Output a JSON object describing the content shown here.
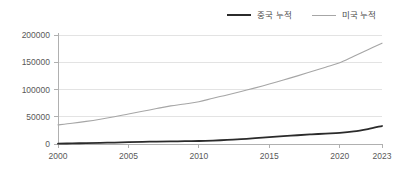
{
  "chart_data": {
    "type": "line",
    "title": "",
    "subtitle": "",
    "xlabel": "",
    "ylabel": "",
    "xlim": [
      2000,
      2023
    ],
    "ylim": [
      0,
      200000
    ],
    "grid": "horizontal",
    "legend_position": "top-right",
    "background_color": "#ffffff",
    "grid_color": "#e3e3e3",
    "axis_color": "#b0b0b0",
    "x": [
      2000,
      2001,
      2002,
      2003,
      2004,
      2005,
      2006,
      2007,
      2008,
      2009,
      2010,
      2011,
      2012,
      2013,
      2014,
      2015,
      2016,
      2017,
      2018,
      2019,
      2020,
      2021,
      2022,
      2023
    ],
    "xticks": [
      2000,
      2005,
      2010,
      2015,
      2020,
      2023
    ],
    "xtick_labels": [
      "2000",
      "2005",
      "2010",
      "2015",
      "2020",
      "2023"
    ],
    "yticks": [
      0,
      50000,
      100000,
      150000,
      200000
    ],
    "ytick_labels": [
      "0",
      "50000",
      "100000",
      "150000",
      "200000"
    ],
    "series": [
      {
        "name": "중국 누적",
        "color": "#2b2b2b",
        "line_width": 1.8,
        "values": [
          700,
          1100,
          1600,
          2100,
          2700,
          3300,
          3900,
          4400,
          4800,
          5100,
          5500,
          6300,
          7400,
          8800,
          10600,
          12600,
          14400,
          16100,
          17700,
          19100,
          20400,
          23000,
          27500,
          33000
        ]
      },
      {
        "name": "미국 누적",
        "color": "#a6a6a6",
        "line_width": 1.1,
        "values": [
          35000,
          38000,
          41500,
          45500,
          50000,
          55000,
          60000,
          65000,
          70000,
          73500,
          77500,
          84000,
          90000,
          96500,
          103000,
          110000,
          117500,
          125000,
          133000,
          141000,
          149000,
          161000,
          173000,
          185000
        ]
      }
    ]
  },
  "legend": {
    "items": [
      {
        "label": "중국 누적"
      },
      {
        "label": "미국 누적"
      }
    ]
  }
}
